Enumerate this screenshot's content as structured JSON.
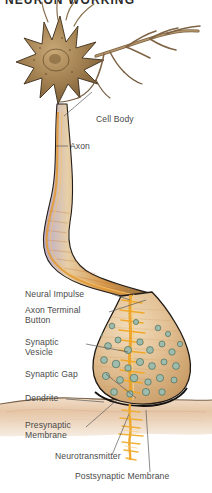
{
  "figure": {
    "title": "NEURON WORKING",
    "background_color": "#ffffff",
    "text_color": "#4a4a4a",
    "width": 212,
    "height": 493
  },
  "palette": {
    "soma_fill": "#9c7a4e",
    "soma_dark": "#6b4f2a",
    "axon_fill": "#d9a86a",
    "axon_outline": "#2b2320",
    "terminal_fill": "#e4c49a",
    "impulse_orange": "#f0a01e",
    "vesicle_teal": "#7fa894",
    "vesicle_outline": "#4c6b5c",
    "membrane_band": "#e8cdb4",
    "leader_line": "#5a5a5a"
  },
  "labels": [
    {
      "id": "cell-body",
      "text": "Cell Body"
    },
    {
      "id": "axon",
      "text": "Axon"
    },
    {
      "id": "neural-impulse",
      "text": "Neural Impulse"
    },
    {
      "id": "axon-terminal-button",
      "text": "Axon Terminal\nButton"
    },
    {
      "id": "synaptic-vesicle",
      "text": "Synaptic\nVesicle"
    },
    {
      "id": "synaptic-gap",
      "text": "Synaptic Gap"
    },
    {
      "id": "dendrite",
      "text": "Dendrite"
    },
    {
      "id": "presynaptic-membrane",
      "text": "Presynaptic\nMembrane"
    },
    {
      "id": "neurotransmitter",
      "text": "Neurotransmitter"
    },
    {
      "id": "postsynaptic-membrane",
      "text": "Postsynaptic Membrane"
    }
  ]
}
